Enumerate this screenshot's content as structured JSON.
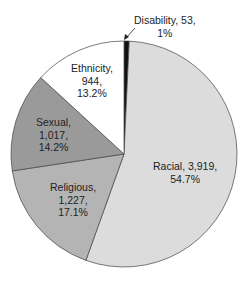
{
  "chart_data": {
    "type": "pie",
    "title": "",
    "start_angle_deg": 0,
    "direction": "clockwise",
    "slices": [
      {
        "label": "Disability",
        "value": 53,
        "percent": "1%",
        "color": "#111111"
      },
      {
        "label": "Racial",
        "value": 3919,
        "percent": "54.7%",
        "color": "#dcdcdc"
      },
      {
        "label": "Religious",
        "value": 1227,
        "percent": "17.1%",
        "color": "#b4b4b4"
      },
      {
        "label": "Sexual",
        "value": 1017,
        "percent": "14.2%",
        "color": "#9a9a9a"
      },
      {
        "label": "Ethnicity",
        "value": 944,
        "percent": "13.2%",
        "color": "#ffffff"
      }
    ]
  },
  "labels": {
    "disability": {
      "line1": "Disability, 53,",
      "line2": "1%"
    },
    "racial": {
      "line1": "Racial, 3,919,",
      "line2": "54.7%"
    },
    "religious": {
      "line1": "Religious,",
      "line2": "1,227,",
      "line3": "17.1%"
    },
    "sexual": {
      "line1": "Sexual,",
      "line2": "1,017,",
      "line3": "14.2%"
    },
    "ethnicity": {
      "line1": "Ethnicity,",
      "line2": "944,",
      "line3": "13.2%"
    }
  }
}
